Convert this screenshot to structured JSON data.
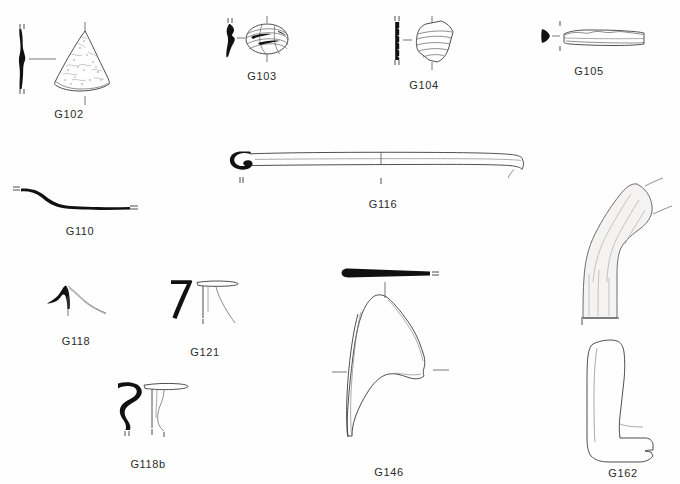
{
  "plate": {
    "title": "Archaeological small finds illustration plate",
    "background_color": "#ffffff",
    "ink_color": "#111111",
    "line_color": "#3b3b3b",
    "caption_color": "#2b2b2b",
    "width": 680,
    "height": 484
  },
  "figures": [
    {
      "id": "G102",
      "label": "G102",
      "caption_x": 69,
      "caption_y": 108,
      "description": "conical / fan-shaped spindle whorl fragment with stippled surface and solid black section profile at left"
    },
    {
      "id": "G103",
      "label": "G103",
      "caption_x": 262,
      "caption_y": 70,
      "description": "ring bead with diagonal banding and solid black teardrop section profile at left"
    },
    {
      "id": "G104",
      "label": "G104",
      "caption_x": 424,
      "caption_y": 79,
      "description": "polygonal sherd with horizontal grooves and solid black notched section profile at left"
    },
    {
      "id": "G105",
      "label": "G105",
      "caption_x": 589,
      "caption_y": 65,
      "description": "elongated horizontal bar with notched upper edge and small black triangular section profile at left"
    },
    {
      "id": "G110",
      "label": "G110",
      "caption_x": 80,
      "caption_y": 225,
      "description": "curved S-shaped solid black rim section profile with end tick marks"
    },
    {
      "id": "G116",
      "label": "G116",
      "caption_x": 383,
      "caption_y": 198,
      "description": "long slender pin with looped head at left, drawn in thin outline, black loop terminal"
    },
    {
      "id": "G118",
      "label": "G118",
      "caption_x": 76,
      "caption_y": 335,
      "description": "small peaked section profile, solid black at left with thin sweeping curve to the right"
    },
    {
      "id": "G121",
      "label": "G121",
      "caption_x": 205,
      "caption_y": 346,
      "description": "hook-shaped solid black rim profile with thin-line flanged rim drawing at right"
    },
    {
      "id": "G118b",
      "label": "G118b",
      "caption_x": 148,
      "caption_y": 458,
      "description": "S-curved solid black rim profile with thin-line flanged rim drawing at right"
    },
    {
      "id": "G146",
      "label": "G146",
      "caption_x": 389,
      "caption_y": 466,
      "description": "large vessel wall fragment in thin outline with a solid black bulb-headed section bar above"
    },
    {
      "id": "G162",
      "label": "G162",
      "caption_x": 623,
      "caption_y": 467,
      "description": "two views of a bent elbow-shaped object: shaded upper view and elongated lower profile outline"
    }
  ]
}
